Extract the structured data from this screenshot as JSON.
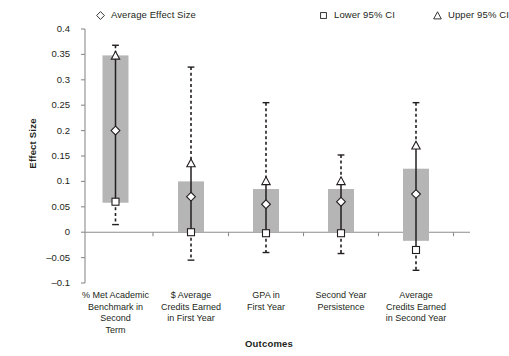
{
  "chart_data": {
    "type": "bar",
    "title": "",
    "subtitle": "",
    "xlabel": "Outcomes",
    "ylabel": "Effect Size",
    "ylim": [
      -0.1,
      0.4
    ],
    "ytick_values": [
      0.4,
      0.35,
      0.3,
      0.25,
      0.2,
      0.15,
      0.1,
      0.05,
      0,
      -0.05,
      -0.1
    ],
    "ytick_labels": [
      "0.4",
      "0.35",
      "0.3",
      "0.25",
      "0.2",
      "0.15",
      "0.1",
      "0.05",
      "0",
      "–0.05",
      "–0.1"
    ],
    "grid": false,
    "legend_position": "top",
    "legend": [
      {
        "label": "Average Effect Size",
        "marker": "diamond"
      },
      {
        "label": "Lower 95% CI",
        "marker": "square"
      },
      {
        "label": "Upper 95% CI",
        "marker": "triangle"
      }
    ],
    "categories": [
      "% Met Academic Benchmark in Second Term",
      "$ Average Credits Earned in First Year",
      "GPA in First Year",
      "Second Year Persistence",
      "Average Credits Earned in Second Year"
    ],
    "category_lines": [
      [
        "% Met Academic",
        "Benchmark in",
        "Second",
        "Term"
      ],
      [
        "$ Average",
        "Credits Earned",
        "in First Year"
      ],
      [
        "GPA in",
        "First Year"
      ],
      [
        "Second Year",
        "Persistence"
      ],
      [
        "Average",
        "Credits Earned",
        "in Second Year"
      ]
    ],
    "bar_color": "#b5b5b5",
    "marker_color": "#ffffff",
    "line_color": "#231f20",
    "series": [
      {
        "name": "Average Effect Size",
        "values": [
          0.2,
          0.07,
          0.055,
          0.06,
          0.075
        ]
      },
      {
        "name": "Lower 95% CI",
        "values": [
          0.06,
          0.0,
          -0.002,
          -0.002,
          -0.035
        ]
      },
      {
        "name": "Upper 95% CI",
        "values": [
          0.347,
          0.135,
          0.1,
          0.1,
          0.17
        ]
      }
    ],
    "bars": [
      {
        "bottom": 0.058,
        "top": 0.348
      },
      {
        "bottom": 0.0,
        "top": 0.1
      },
      {
        "bottom": 0.0,
        "top": 0.085
      },
      {
        "bottom": 0.0,
        "top": 0.085
      },
      {
        "bottom": -0.017,
        "top": 0.125
      }
    ],
    "whiskers": [
      {
        "upper": 0.368,
        "lower": 0.015
      },
      {
        "upper": 0.325,
        "lower": -0.055
      },
      {
        "upper": 0.255,
        "lower": -0.04
      },
      {
        "upper": 0.152,
        "lower": -0.042
      },
      {
        "upper": 0.255,
        "lower": -0.075
      }
    ]
  }
}
